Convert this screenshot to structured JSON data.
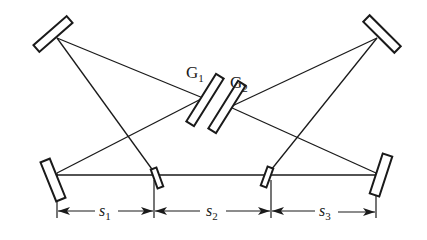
{
  "diagram": {
    "type": "optical-layout",
    "colors": {
      "line": "#1a1a1a",
      "background": "#ffffff"
    },
    "gratings": [
      {
        "id": "G1",
        "label": "G",
        "subscript": "1"
      },
      {
        "id": "G2",
        "label": "G",
        "subscript": "2"
      }
    ],
    "dimensions": [
      {
        "id": "s1",
        "label": "s",
        "subscript": "1"
      },
      {
        "id": "s2",
        "label": "s",
        "subscript": "2"
      },
      {
        "id": "s3",
        "label": "s",
        "subscript": "3"
      }
    ],
    "components": [
      "mirror-top-left",
      "mirror-top-right",
      "mirror-bottom-left",
      "mirror-bottom-right",
      "fold-mirror-left",
      "fold-mirror-right",
      "grating-G1",
      "grating-G2"
    ]
  }
}
